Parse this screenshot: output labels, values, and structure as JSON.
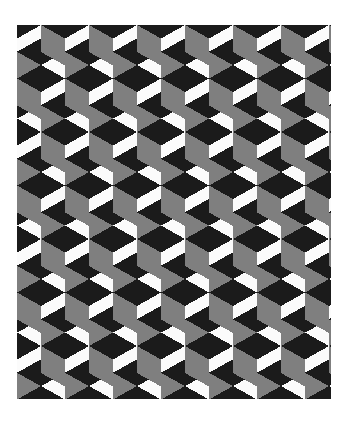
{
  "document": {
    "kind": "optical-illusion-figure",
    "title": "Tumbling Blocks Isometric Cube Pattern",
    "alt_text": "Repeating isometric cube (tumbling blocks) optical illusion pattern in black, gray and white",
    "background_color": "#ffffff",
    "canvas": {
      "width": 345,
      "height": 422
    }
  },
  "figure": {
    "name": "tumbling-blocks-pattern",
    "frame": {
      "x": 17,
      "y": 25,
      "width": 314,
      "height": 374
    },
    "colors": {
      "top_face": "#1b1b1b",
      "left_face": "#7f7f7f",
      "right_face": "#fbfbfb",
      "background": "#ffffff"
    },
    "geometry": {
      "cube_width": 48,
      "cube_half_width": 24,
      "cube_side_height": 27,
      "cube_top_half_height": 13.5,
      "row_period": 53.5,
      "column_period": 48,
      "column_offset_x": 24,
      "columns": 7,
      "rows": 8,
      "start_x": 17,
      "start_y": 25
    },
    "face_labels": {
      "top": "top face",
      "left": "left face",
      "right": "right face"
    }
  }
}
